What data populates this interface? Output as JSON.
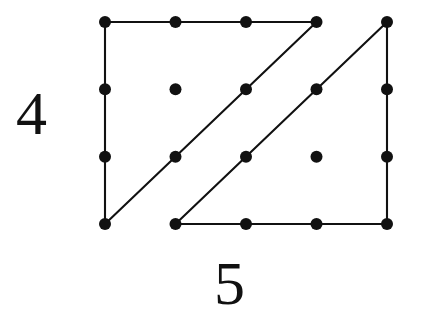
{
  "figure": {
    "background_color": "#ffffff",
    "ink_color": "#111111",
    "width": 421,
    "height": 329
  },
  "labels": {
    "rows_label": "4",
    "cols_label": "5",
    "rows_label_name": "row-count-label",
    "cols_label_name": "column-count-label"
  },
  "chart_data": {
    "type": "scatter",
    "xlabel": "5",
    "ylabel": "4",
    "grid": false,
    "legend": null,
    "columns": 5,
    "rows": 4,
    "x": [
      0,
      1,
      2,
      3,
      4
    ],
    "y": [
      0,
      1,
      2,
      3
    ],
    "xlim": [
      0,
      4
    ],
    "ylim": [
      0,
      3
    ],
    "point_style": {
      "marker": "filled-circle",
      "radius_px": 6,
      "color": "#111111"
    },
    "pixel_geometry": {
      "col_x": [
        105,
        175.5,
        246,
        316.5,
        387
      ],
      "row_y": [
        22,
        89.3,
        156.7,
        224
      ]
    },
    "points": [
      {
        "col": 0,
        "row": 0,
        "x": 105,
        "y": 22
      },
      {
        "col": 1,
        "row": 0,
        "x": 175.5,
        "y": 22
      },
      {
        "col": 2,
        "row": 0,
        "x": 246,
        "y": 22
      },
      {
        "col": 3,
        "row": 0,
        "x": 316.5,
        "y": 22
      },
      {
        "col": 4,
        "row": 0,
        "x": 387,
        "y": 22
      },
      {
        "col": 0,
        "row": 1,
        "x": 105,
        "y": 89.3
      },
      {
        "col": 1,
        "row": 1,
        "x": 175.5,
        "y": 89.3
      },
      {
        "col": 2,
        "row": 1,
        "x": 246,
        "y": 89.3
      },
      {
        "col": 3,
        "row": 1,
        "x": 316.5,
        "y": 89.3
      },
      {
        "col": 4,
        "row": 1,
        "x": 387,
        "y": 89.3
      },
      {
        "col": 0,
        "row": 2,
        "x": 105,
        "y": 156.7
      },
      {
        "col": 1,
        "row": 2,
        "x": 175.5,
        "y": 156.7
      },
      {
        "col": 2,
        "row": 2,
        "x": 246,
        "y": 156.7
      },
      {
        "col": 3,
        "row": 2,
        "x": 316.5,
        "y": 156.7
      },
      {
        "col": 4,
        "row": 2,
        "x": 387,
        "y": 156.7
      },
      {
        "col": 0,
        "row": 3,
        "x": 105,
        "y": 224
      },
      {
        "col": 1,
        "row": 3,
        "x": 175.5,
        "y": 224
      },
      {
        "col": 2,
        "row": 3,
        "x": 246,
        "y": 224
      },
      {
        "col": 3,
        "row": 3,
        "x": 316.5,
        "y": 224
      },
      {
        "col": 4,
        "row": 3,
        "x": 387,
        "y": 224
      }
    ],
    "shapes": [
      {
        "name": "triangle-left",
        "kind": "right-triangle",
        "stroke_color": "#111111",
        "stroke_width": 2.1,
        "vertices": [
          {
            "col": 0,
            "row": 0,
            "x": 105,
            "y": 22
          },
          {
            "col": 3,
            "row": 0,
            "x": 316.5,
            "y": 22
          },
          {
            "col": 0,
            "row": 3,
            "x": 105,
            "y": 224
          }
        ],
        "edges": [
          {
            "name": "top-edge",
            "from": [
              105,
              22
            ],
            "to": [
              316.5,
              22
            ]
          },
          {
            "name": "left-edge",
            "from": [
              105,
              22
            ],
            "to": [
              105,
              224
            ]
          },
          {
            "name": "hypotenuse",
            "from": [
              316.5,
              22
            ],
            "to": [
              105,
              224
            ]
          }
        ],
        "points_on_hypotenuse": [
          {
            "col": 1,
            "row": 2,
            "x": 175.5,
            "y": 156.7
          },
          {
            "col": 2,
            "row": 1,
            "x": 246,
            "y": 89.3
          }
        ]
      },
      {
        "name": "triangle-right",
        "kind": "right-triangle",
        "stroke_color": "#111111",
        "stroke_width": 2.1,
        "vertices": [
          {
            "col": 1,
            "row": 3,
            "x": 175.5,
            "y": 224
          },
          {
            "col": 4,
            "row": 3,
            "x": 387,
            "y": 224
          },
          {
            "col": 4,
            "row": 0,
            "x": 387,
            "y": 22
          }
        ],
        "edges": [
          {
            "name": "bottom-edge",
            "from": [
              175.5,
              224
            ],
            "to": [
              387,
              224
            ]
          },
          {
            "name": "right-edge",
            "from": [
              387,
              224
            ],
            "to": [
              387,
              22
            ]
          },
          {
            "name": "hypotenuse",
            "from": [
              175.5,
              224
            ],
            "to": [
              387,
              22
            ]
          }
        ],
        "points_on_hypotenuse": [
          {
            "col": 2,
            "row": 2,
            "x": 246,
            "y": 156.7
          },
          {
            "col": 3,
            "row": 1,
            "x": 316.5,
            "y": 89.3
          }
        ]
      }
    ],
    "isolated_points": [
      {
        "col": 1,
        "row": 1,
        "x": 175.5,
        "y": 89.3
      },
      {
        "col": 3,
        "row": 2,
        "x": 316.5,
        "y": 156.7
      }
    ]
  }
}
